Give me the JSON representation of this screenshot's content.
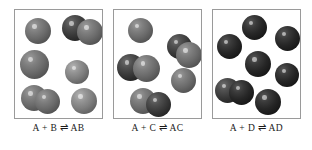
{
  "figure": {
    "background_color": "#ffffff",
    "panel_border_color": "#9a9a9a"
  },
  "panels": [
    {
      "id": "panel-ab",
      "caption": "A + B ⇌ AB",
      "reactant_a": "A",
      "reactant_b": "B",
      "product": "AB",
      "arrow": "⇌",
      "box": {
        "left": 14,
        "top": 9,
        "width": 89,
        "height": 110
      },
      "spheres": [
        {
          "name": "sphere-a-1",
          "shade": "mid",
          "left": 10,
          "top": 8,
          "size": 26
        },
        {
          "name": "sphere-ab-1a",
          "shade": "dark",
          "left": 47,
          "top": 5,
          "size": 26
        },
        {
          "name": "sphere-ab-1b",
          "shade": "mid",
          "left": 62,
          "top": 9,
          "size": 26
        },
        {
          "name": "sphere-a-2",
          "shade": "mid",
          "left": 5,
          "top": 40,
          "size": 29
        },
        {
          "name": "sphere-a-3",
          "shade": "light",
          "left": 50,
          "top": 50,
          "size": 24
        },
        {
          "name": "sphere-ab-2a",
          "shade": "mid",
          "left": 6,
          "top": 75,
          "size": 26
        },
        {
          "name": "sphere-ab-2b",
          "shade": "mid",
          "left": 20,
          "top": 79,
          "size": 25
        },
        {
          "name": "sphere-a-4",
          "shade": "light",
          "left": 56,
          "top": 78,
          "size": 26
        }
      ]
    },
    {
      "id": "panel-ac",
      "caption": "A + C ⇌ AC",
      "reactant_a": "A",
      "reactant_b": "C",
      "product": "AC",
      "arrow": "⇌",
      "box": {
        "left": 113,
        "top": 9,
        "width": 89,
        "height": 110
      },
      "spheres": [
        {
          "name": "sphere-a-1",
          "shade": "mid",
          "left": 14,
          "top": 8,
          "size": 25
        },
        {
          "name": "sphere-ac-1a",
          "shade": "dark",
          "left": 53,
          "top": 24,
          "size": 25
        },
        {
          "name": "sphere-ac-1b",
          "shade": "mid",
          "left": 62,
          "top": 32,
          "size": 26
        },
        {
          "name": "sphere-ac-2a",
          "shade": "dark",
          "left": 3,
          "top": 44,
          "size": 27
        },
        {
          "name": "sphere-ac-2b",
          "shade": "mid",
          "left": 19,
          "top": 45,
          "size": 27
        },
        {
          "name": "sphere-a-2",
          "shade": "mid",
          "left": 57,
          "top": 58,
          "size": 25
        },
        {
          "name": "sphere-ac-3a",
          "shade": "mid",
          "left": 16,
          "top": 78,
          "size": 26
        },
        {
          "name": "sphere-ac-3b",
          "shade": "dark",
          "left": 32,
          "top": 82,
          "size": 25
        }
      ]
    },
    {
      "id": "panel-ad",
      "caption": "A + D ⇌ AD",
      "reactant_a": "A",
      "reactant_b": "D",
      "product": "AD",
      "arrow": "⇌",
      "box": {
        "left": 212,
        "top": 9,
        "width": 89,
        "height": 110
      },
      "spheres": [
        {
          "name": "sphere-a-1",
          "shade": "verydark",
          "left": 29,
          "top": 5,
          "size": 25
        },
        {
          "name": "sphere-d-1",
          "shade": "verydark",
          "left": 62,
          "top": 16,
          "size": 25
        },
        {
          "name": "sphere-a-2",
          "shade": "verydark",
          "left": 4,
          "top": 24,
          "size": 25
        },
        {
          "name": "sphere-d-2",
          "shade": "verydark",
          "left": 32,
          "top": 41,
          "size": 26
        },
        {
          "name": "sphere-d-3",
          "shade": "verydark",
          "left": 62,
          "top": 53,
          "size": 24
        },
        {
          "name": "sphere-ad-1a",
          "shade": "dark",
          "left": 2,
          "top": 68,
          "size": 25
        },
        {
          "name": "sphere-ad-1b",
          "shade": "verydark",
          "left": 16,
          "top": 70,
          "size": 25
        },
        {
          "name": "sphere-d-4",
          "shade": "verydark",
          "left": 42,
          "top": 79,
          "size": 26
        }
      ]
    }
  ]
}
